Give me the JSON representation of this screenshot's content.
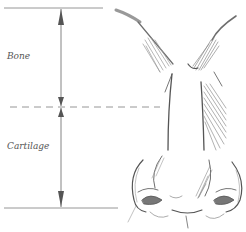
{
  "diagram": {
    "labels": {
      "upper_section": "Bone",
      "lower_section": "Cartilage"
    },
    "colors": {
      "line": "#8a8a8a",
      "arrow": "#555555",
      "sketch": "#6e6e6e",
      "hatch": "#9a9a9a",
      "text": "#555555"
    }
  }
}
